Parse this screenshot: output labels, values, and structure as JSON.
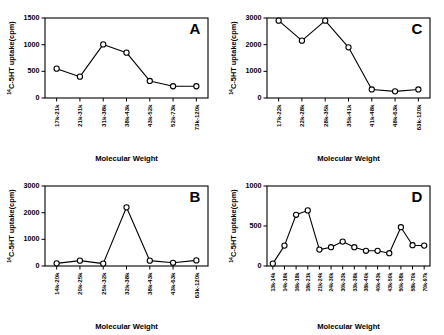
{
  "figure": {
    "panel_count": 4,
    "shared_ylabel_prefix": "14",
    "shared_ylabel": "C-5HT uptake(cpm)",
    "shared_xlabel": "Molecular Weight",
    "line_color": "#000000",
    "marker_fill": "#ffffff",
    "background": "#ffffff"
  },
  "chart_data": [
    {
      "panel": "A",
      "type": "line",
      "title": "A",
      "xlabel": "Molecular Weight",
      "ylabel": "14C-5HT uptake(cpm)",
      "categories": [
        "17k-21k",
        "21k-31k",
        "31k-38k",
        "38k-43k",
        "43k-52k",
        "52k-73k",
        "73k-120k"
      ],
      "values": [
        550,
        400,
        1005,
        850,
        320,
        220,
        220
      ],
      "ylim": [
        0,
        1500
      ],
      "yticks": [
        0,
        500,
        1000,
        1500
      ],
      "ytick_labels": [
        "0",
        "500",
        "1000",
        "1500"
      ],
      "grid": false,
      "legend": false,
      "marker": "open-circle"
    },
    {
      "panel": "B",
      "type": "line",
      "title": "B",
      "xlabel": "Molecular Weight",
      "ylabel": "14C-5HT uptake(cpm)",
      "categories": [
        "14k-20k",
        "20k-25k",
        "25k-32k",
        "32k-38k",
        "38k-43k",
        "43k-63k",
        "63k-120k"
      ],
      "values": [
        100,
        200,
        90,
        2200,
        200,
        120,
        210
      ],
      "ylim": [
        0,
        3000
      ],
      "yticks": [
        0,
        1000,
        2000,
        3000
      ],
      "ytick_labels": [
        "0",
        "1000",
        "2000",
        "3000"
      ],
      "grid": false,
      "legend": false,
      "marker": "open-circle"
    },
    {
      "panel": "C",
      "type": "line",
      "title": "C",
      "xlabel": "Molecular Weight",
      "ylabel": "14C-5HT uptake(cpm)",
      "categories": [
        "17k-22k",
        "22k-28k",
        "28k-35k",
        "35k-41k",
        "41k-48k",
        "48k-63k",
        "63k-120k"
      ],
      "values": [
        2900,
        2150,
        2900,
        1900,
        320,
        250,
        320
      ],
      "ylim": [
        0,
        3000
      ],
      "yticks": [
        0,
        1000,
        2000,
        3000
      ],
      "ytick_labels": [
        "0",
        "1000",
        "2000",
        "3000"
      ],
      "grid": false,
      "legend": false,
      "marker": "open-circle"
    },
    {
      "panel": "D",
      "type": "line",
      "title": "D",
      "xlabel": "Molecular Weight",
      "ylabel": "14C-5HT uptake(cpm)",
      "categories": [
        "13k-14k",
        "14k-16k",
        "16k-18k",
        "18k-21k",
        "21k-24k",
        "24k-30k",
        "30k-33k",
        "33k-38k",
        "38k-40k",
        "40k-43k",
        "43k-50k",
        "50k-58k",
        "58k-70k",
        "70k-97k"
      ],
      "values": [
        30,
        255,
        640,
        695,
        205,
        235,
        305,
        235,
        190,
        190,
        160,
        485,
        260,
        255
      ],
      "ylim": [
        0,
        1000
      ],
      "yticks": [
        0,
        500,
        1000
      ],
      "ytick_labels": [
        "0",
        "500",
        "1000"
      ],
      "grid": false,
      "legend": false,
      "marker": "open-circle"
    }
  ]
}
